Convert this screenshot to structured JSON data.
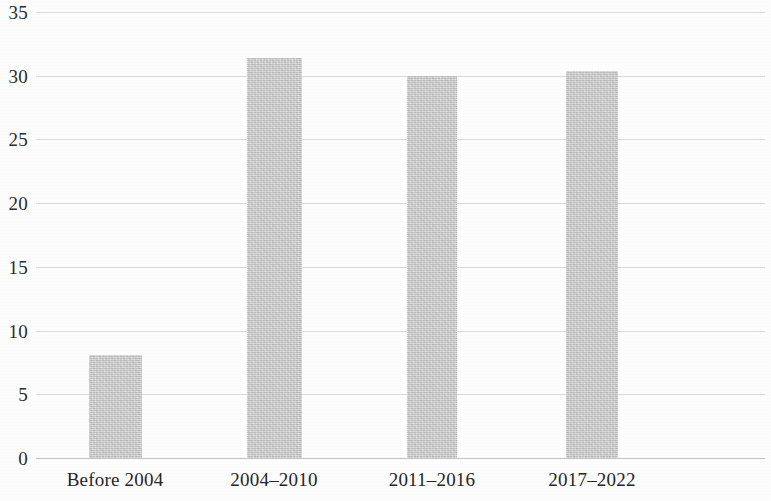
{
  "chart_data": {
    "type": "bar",
    "title": "",
    "subtitle": "",
    "xlabel": "",
    "ylabel": "",
    "categories": [
      "Before 2004",
      "2004–2010",
      "2011–2016",
      "2017–2022"
    ],
    "values": [
      8.1,
      31.4,
      30.0,
      30.4
    ],
    "ylim": [
      0,
      35
    ],
    "y_ticks": [
      0,
      5,
      10,
      15,
      20,
      25,
      30,
      35
    ],
    "y_tick_labels": [
      "0",
      "5",
      "10",
      "15",
      "20",
      "25",
      "30",
      "35"
    ],
    "grid": "horizontal",
    "legend": "none",
    "series": [
      {
        "name": "",
        "values": [
          8.1,
          31.4,
          30.0,
          30.4
        ]
      }
    ],
    "colors": {
      "bar_fill": "#c9c9c9",
      "gridline": "#d7dbdf",
      "axis_line": "#bdc2c7",
      "tick_label": "#2c2c2c",
      "background": "#fefefe"
    },
    "bar_geometry": [
      {
        "center_pct": 10.84,
        "width_px": 53
      },
      {
        "center_pct": 32.65,
        "width_px": 55
      },
      {
        "center_pct": 54.32,
        "width_px": 50
      },
      {
        "center_pct": 76.27,
        "width_px": 52
      }
    ]
  }
}
